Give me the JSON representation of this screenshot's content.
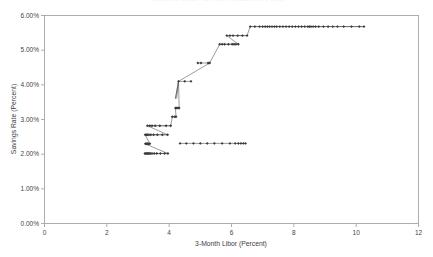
{
  "figure": {
    "background": "#ffffff",
    "frame_color": "#9a9a9a",
    "marker_color": "#3a3a3a",
    "line_color": "#4a4a4a",
    "clipped_title": "Savings Rate versus 3-Month Libor"
  },
  "chart_data": {
    "type": "scatter",
    "title": "",
    "xlabel": "3-Month Libor (Percent)",
    "ylabel": "Savings Rate (Percent)",
    "xlim": [
      0,
      12
    ],
    "ylim": [
      0,
      6
    ],
    "xticks": [
      0,
      2,
      4,
      6,
      8,
      10,
      12
    ],
    "xtick_labels": [
      "0",
      "2",
      "4",
      "6",
      "8",
      "10",
      "12"
    ],
    "yticks": [
      0,
      1,
      2,
      3,
      4,
      5,
      6
    ],
    "ytick_labels": [
      "0.00%",
      "1.00%",
      "2.00%",
      "3.00%",
      "4.00%",
      "5.00%",
      "6.00%"
    ],
    "grid": false,
    "legend": null,
    "connected": true,
    "marker": "diamond",
    "series": [
      {
        "name": "Savings Rate vs 3-Month Libor",
        "x": [
          3.22,
          3.25,
          3.28,
          3.3,
          3.33,
          3.36,
          3.4,
          3.45,
          3.52,
          3.6,
          3.72,
          3.85,
          3.96,
          3.24,
          3.26,
          3.29,
          3.31,
          3.34,
          3.38,
          3.23,
          3.27,
          3.3,
          3.35,
          3.41,
          3.5,
          3.62,
          3.78,
          3.95,
          3.3,
          3.38,
          3.45,
          3.55,
          3.7,
          3.9,
          4.05,
          4.1,
          4.18,
          4.22,
          4.2,
          4.24,
          4.28,
          4.32,
          4.3,
          4.5,
          4.7,
          4.92,
          5.02,
          5.25,
          5.3,
          5.62,
          5.7,
          5.78,
          5.9,
          6.02,
          6.08,
          6.14,
          6.22,
          5.85,
          5.95,
          6.05,
          6.2,
          6.35,
          6.5,
          6.6,
          6.75,
          6.9,
          7.0,
          7.08,
          7.15,
          7.22,
          7.3,
          7.38,
          7.45,
          7.55,
          7.65,
          7.75,
          7.85,
          7.95,
          8.05,
          8.15,
          8.25,
          8.35,
          8.45,
          8.5,
          8.55,
          8.62,
          8.7,
          8.8,
          8.95,
          9.1,
          9.25,
          9.4,
          9.6,
          9.85,
          10.1,
          10.25,
          4.35,
          4.55,
          4.78,
          5.0,
          5.22,
          5.45,
          5.7,
          5.95,
          6.12,
          6.22,
          6.3,
          6.38,
          6.45
        ],
        "y": [
          2.02,
          2.02,
          2.02,
          2.02,
          2.02,
          2.02,
          2.02,
          2.02,
          2.02,
          2.02,
          2.02,
          2.02,
          2.02,
          2.3,
          2.3,
          2.3,
          2.3,
          2.3,
          2.3,
          2.56,
          2.56,
          2.56,
          2.56,
          2.56,
          2.56,
          2.56,
          2.56,
          2.56,
          2.82,
          2.82,
          2.82,
          2.82,
          2.82,
          2.82,
          2.82,
          3.08,
          3.08,
          3.08,
          3.33,
          3.33,
          3.33,
          3.33,
          4.1,
          4.1,
          4.1,
          4.63,
          4.63,
          4.63,
          4.63,
          5.17,
          5.17,
          5.17,
          5.17,
          5.17,
          5.17,
          5.17,
          5.17,
          5.42,
          5.42,
          5.42,
          5.42,
          5.42,
          5.42,
          5.68,
          5.68,
          5.68,
          5.68,
          5.68,
          5.68,
          5.68,
          5.68,
          5.68,
          5.68,
          5.68,
          5.68,
          5.68,
          5.68,
          5.68,
          5.68,
          5.68,
          5.68,
          5.68,
          5.68,
          5.68,
          5.68,
          5.68,
          5.68,
          5.68,
          5.68,
          5.68,
          5.68,
          5.68,
          5.68,
          5.68,
          5.68,
          5.68,
          2.31,
          2.31,
          2.31,
          2.31,
          2.31,
          2.31,
          2.31,
          2.31,
          2.31,
          2.31,
          2.31,
          2.31,
          2.31
        ]
      }
    ],
    "path": {
      "description": "Stepwise monotone rising path connecting the plotted points",
      "vertices_x": [
        3.22,
        3.96,
        3.22,
        3.38,
        3.23,
        3.95,
        3.3,
        4.05,
        4.1,
        4.22,
        4.2,
        4.32,
        4.3,
        4.2,
        4.3,
        5.3,
        5.62,
        6.22,
        5.85,
        6.5,
        6.6,
        10.25
      ],
      "vertices_y": [
        2.02,
        2.02,
        2.3,
        2.3,
        2.56,
        2.56,
        2.82,
        2.82,
        3.08,
        3.08,
        3.33,
        3.33,
        4.1,
        3.6,
        4.1,
        4.63,
        5.17,
        5.17,
        5.42,
        5.42,
        5.68,
        5.68
      ]
    },
    "branch": {
      "description": "Lower flat branch at 2.31% extending right from x≈4.3 to x≈6.45",
      "x": [
        4.35,
        6.45
      ],
      "y": [
        2.31,
        2.31
      ]
    }
  }
}
